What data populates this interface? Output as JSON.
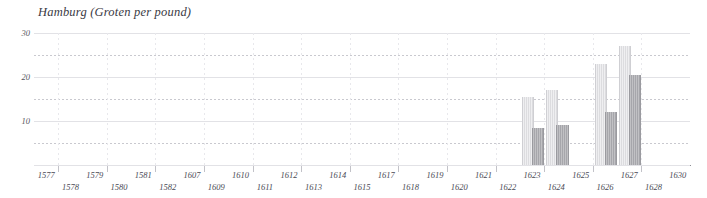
{
  "chart_data": {
    "type": "bar",
    "title": "Hamburg (Groten per pound)",
    "xlabel": "",
    "ylabel": "Groten per pound",
    "ylim": [
      0,
      30
    ],
    "yticks": [
      10,
      20,
      30
    ],
    "ytick_labels": [
      "10",
      "20",
      "30"
    ],
    "grid": true,
    "grid_step": 5,
    "legend_position": "none",
    "categories": [
      "1577",
      "1578",
      "1579",
      "1580",
      "1581",
      "1582",
      "1607",
      "1609",
      "1610",
      "1611",
      "1612",
      "1613",
      "1614",
      "1615",
      "1617",
      "1618",
      "1619",
      "1620",
      "1621",
      "1622",
      "1623",
      "1624",
      "1625",
      "1626",
      "1627",
      "1628",
      "1630"
    ],
    "series": [
      {
        "name": "light",
        "values": [
          null,
          null,
          null,
          null,
          null,
          null,
          null,
          null,
          null,
          null,
          null,
          null,
          null,
          null,
          null,
          null,
          null,
          null,
          null,
          null,
          15.5,
          17.0,
          null,
          23.0,
          27.0,
          null,
          null
        ]
      },
      {
        "name": "dark",
        "values": [
          null,
          null,
          null,
          null,
          null,
          null,
          null,
          null,
          null,
          null,
          null,
          null,
          null,
          null,
          null,
          null,
          null,
          null,
          null,
          null,
          8.5,
          9.2,
          null,
          12.0,
          20.5,
          null,
          null
        ]
      }
    ]
  },
  "axis": {
    "y_labels": [
      "30",
      "20",
      "10"
    ],
    "x_labels_row0": [
      "1577",
      "1579",
      "1581",
      "1607",
      "1610",
      "1612",
      "1614",
      "1617",
      "1619",
      "1621",
      "1623",
      "1625",
      "1627",
      "1630"
    ],
    "x_labels_row1": [
      "1578",
      "1580",
      "1582",
      "1609",
      "1611",
      "1613",
      "1615",
      "1618",
      "1620",
      "1622",
      "1624",
      "1626",
      "1628"
    ]
  },
  "colors": {
    "bar_light": "#dcdcdf",
    "bar_dark": "#a6a6ab",
    "axis": "#8f8f96",
    "grid": "#c9c9cf",
    "text": "#4a4a55",
    "title": "#3a3a44",
    "background": "#ffffff"
  },
  "title": {
    "text": "Hamburg (Groten per pound)"
  }
}
